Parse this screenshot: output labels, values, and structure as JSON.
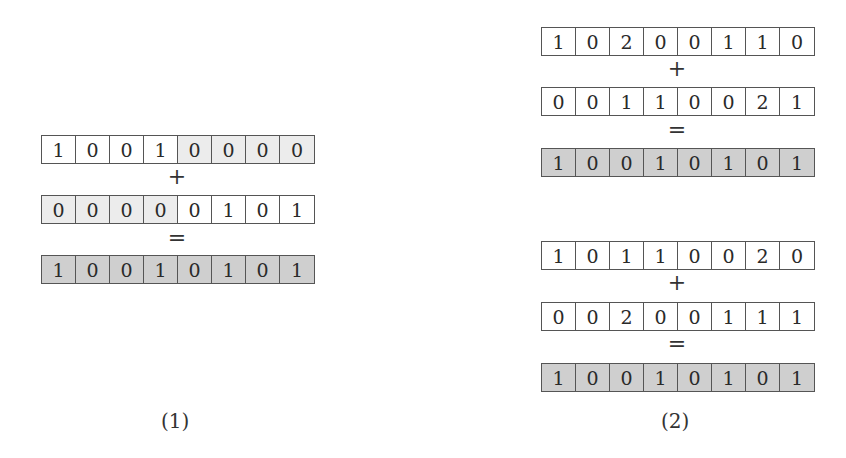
{
  "colors": {
    "white": "#ffffff",
    "light_shade": "#ececec",
    "dark_shade": "#cfcfcf",
    "border": "#555555"
  },
  "panels": [
    {
      "caption": "(1)",
      "equations": [
        {
          "operand_a": {
            "values": [
              "1",
              "0",
              "0",
              "1",
              "0",
              "0",
              "0",
              "0"
            ],
            "shading": [
              "white",
              "white",
              "white",
              "white",
              "light",
              "light",
              "light",
              "light"
            ]
          },
          "plus": "+",
          "operand_b": {
            "values": [
              "0",
              "0",
              "0",
              "0",
              "0",
              "1",
              "0",
              "1"
            ],
            "shading": [
              "light",
              "light",
              "light",
              "light",
              "white",
              "white",
              "white",
              "white"
            ]
          },
          "equals": "=",
          "result": {
            "values": [
              "1",
              "0",
              "0",
              "1",
              "0",
              "1",
              "0",
              "1"
            ],
            "shading": [
              "dark",
              "dark",
              "dark",
              "dark",
              "dark",
              "dark",
              "dark",
              "dark"
            ]
          }
        }
      ]
    },
    {
      "caption": "(2)",
      "equations": [
        {
          "operand_a": {
            "values": [
              "1",
              "0",
              "2",
              "0",
              "0",
              "1",
              "1",
              "0"
            ],
            "shading": [
              "white",
              "white",
              "white",
              "white",
              "white",
              "white",
              "white",
              "white"
            ]
          },
          "plus": "+",
          "operand_b": {
            "values": [
              "0",
              "0",
              "1",
              "1",
              "0",
              "0",
              "2",
              "1"
            ],
            "shading": [
              "white",
              "white",
              "white",
              "white",
              "white",
              "white",
              "white",
              "white"
            ]
          },
          "equals": "=",
          "result": {
            "values": [
              "1",
              "0",
              "0",
              "1",
              "0",
              "1",
              "0",
              "1"
            ],
            "shading": [
              "dark",
              "dark",
              "dark",
              "dark",
              "dark",
              "dark",
              "dark",
              "dark"
            ]
          }
        },
        {
          "operand_a": {
            "values": [
              "1",
              "0",
              "1",
              "1",
              "0",
              "0",
              "2",
              "0"
            ],
            "shading": [
              "white",
              "white",
              "white",
              "white",
              "white",
              "white",
              "white",
              "white"
            ]
          },
          "plus": "+",
          "operand_b": {
            "values": [
              "0",
              "0",
              "2",
              "0",
              "0",
              "1",
              "1",
              "1"
            ],
            "shading": [
              "white",
              "white",
              "white",
              "white",
              "white",
              "white",
              "white",
              "white"
            ]
          },
          "equals": "=",
          "result": {
            "values": [
              "1",
              "0",
              "0",
              "1",
              "0",
              "1",
              "0",
              "1"
            ],
            "shading": [
              "dark",
              "dark",
              "dark",
              "dark",
              "dark",
              "dark",
              "dark",
              "dark"
            ]
          }
        }
      ]
    }
  ]
}
